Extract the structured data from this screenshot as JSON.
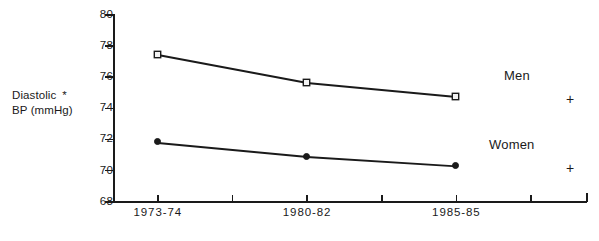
{
  "chart_data": {
    "type": "line",
    "title": "",
    "xlabel": "",
    "ylabel": "Diastolic BP (mmHg)",
    "ylabel_line1": "Diastolic",
    "ylabel_line2": "BP  (mmHg)",
    "ylabel_footnote_marker": "*",
    "categories": [
      "1973-74",
      "1980-82",
      "1985-85"
    ],
    "ylim": [
      68,
      80
    ],
    "yticks": [
      68,
      70,
      72,
      74,
      76,
      78,
      80
    ],
    "ytick_labels": [
      "68",
      "70",
      "72",
      "74",
      "76",
      "78",
      "80"
    ],
    "grid": false,
    "legend_position": "inline-right",
    "series": [
      {
        "name": "Men",
        "marker": "square",
        "values": [
          77.4,
          75.6,
          74.7
        ],
        "annotation": "+"
      },
      {
        "name": "Women",
        "marker": "circle",
        "values": [
          71.8,
          70.9,
          70.3
        ],
        "annotation": "+"
      }
    ],
    "annotations": [
      {
        "text": "+",
        "series": "Men"
      },
      {
        "text": "+",
        "series": "Women"
      }
    ]
  },
  "colors": {
    "ink": "#1a1a1a",
    "background": "#ffffff"
  }
}
